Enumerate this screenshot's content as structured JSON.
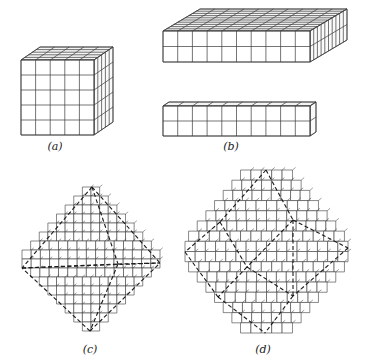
{
  "figure": {
    "stroke": "#3a3a3a",
    "dash_stroke": "#1a1a1a",
    "background": "#ffffff",
    "panels": [
      {
        "id": "a",
        "label": "(a)",
        "description": "5x5x5 cube of unit cells",
        "type": "box",
        "front": {
          "x": 21,
          "y": 60,
          "w": 73,
          "h": 75
        },
        "cols": 5,
        "rows": 5,
        "depth": 5,
        "offset": {
          "dx": 19,
          "dy": -13
        },
        "label_pos": {
          "x": 55,
          "y": 140
        }
      },
      {
        "id": "b1",
        "label": "",
        "description": "10x2x10 slab",
        "type": "box",
        "front": {
          "x": 163,
          "y": 31,
          "w": 147,
          "h": 31
        },
        "cols": 10,
        "rows": 2,
        "depth": 10,
        "offset": {
          "dx": 37,
          "dy": -22
        },
        "label_pos": null
      },
      {
        "id": "b2",
        "label": "(b)",
        "description": "10x2x1 bar",
        "type": "box",
        "front": {
          "x": 163,
          "y": 106,
          "w": 147,
          "h": 30
        },
        "cols": 10,
        "rows": 2,
        "depth": 1,
        "offset": {
          "dx": 6,
          "dy": -4
        },
        "label_pos": {
          "x": 231,
          "y": 140
        }
      },
      {
        "id": "c",
        "label": "(c)",
        "description": "stepped octahedron built from cubes",
        "type": "octahedron",
        "top": [
          92,
          187
        ],
        "bottom": [
          90,
          331
        ],
        "left": [
          22,
          268
        ],
        "right": [
          160,
          263
        ],
        "center": [
          88,
          272
        ],
        "steps": 8,
        "label_pos": {
          "x": 90,
          "y": 343
        }
      },
      {
        "id": "d",
        "label": "(d)",
        "description": "stepped rhombic dodecahedron built from cubes",
        "type": "dodecahedron",
        "top": [
          266,
          170
        ],
        "bottom": [
          265,
          333
        ],
        "left": [
          185,
          252
        ],
        "right": [
          348,
          248
        ],
        "center": [
          247,
          267
        ],
        "ul": [
          220,
          222
        ],
        "ur": [
          293,
          220
        ],
        "ll": [
          218,
          297
        ],
        "lr": [
          293,
          296
        ],
        "steps": 8,
        "label_pos": {
          "x": 263,
          "y": 343
        }
      }
    ]
  }
}
